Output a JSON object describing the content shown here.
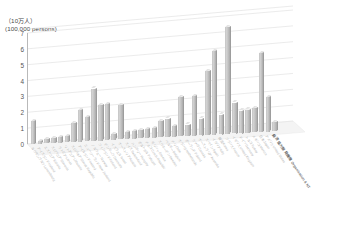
{
  "chart_data": {
    "type": "bar",
    "title": "",
    "ylabel_jp": "（10万人）",
    "ylabel_en": "(100,000 persons)",
    "ylim": [
      0,
      7
    ],
    "yticks": [
      0,
      1,
      2,
      3,
      4,
      5,
      6,
      7
    ],
    "grid": true,
    "legend": "none",
    "projection": "3d-perspective",
    "xlabel": "",
    "categories": [
      "ルクセンブルク Luxembourg",
      "アイスランド Iceland",
      "エストニア Estonia",
      "スロベニア Slovenia",
      "ラトビア Latvia",
      "リトアニア Lithuania",
      "スロバキア Slovak Republic",
      "アイルランド Ireland",
      "ニュージーランド New Zealand",
      "ノルウェー Norway",
      "フィンランド Finland",
      "デンマーク Denmark",
      "イスラエル Israel",
      "オーストリア Austria",
      "スイス Switzerland",
      "ハンガリー Hungary",
      "ポルトガル Portugal",
      "チェコ Czech Republic",
      "ギリシャ Greece",
      "スウェーデン Sweden",
      "ベルギー Belgium",
      "チリ Chile",
      "オランダ Netherlands",
      "ポーランド Poland",
      "カナダ Canada",
      "オーストラリア Australia",
      "スペイン Spain",
      "イタリア Italy",
      "韓国 Korea",
      "フランス France",
      "イギリス United Kingdom",
      "ドイツ Germany",
      "トルコ Turkey",
      "メキシコ Mexico",
      "日本 Japan",
      "アメリカ United States",
      "経済協力開発機構 Organisation & NT"
    ],
    "values": [
      1.45,
      0.15,
      0.25,
      0.3,
      0.35,
      0.4,
      1.2,
      2.0,
      1.55,
      3.35,
      2.25,
      2.3,
      0.35,
      2.2,
      0.45,
      0.5,
      0.55,
      0.6,
      0.65,
      1.05,
      1.2,
      0.7,
      2.55,
      0.75,
      2.6,
      1.1,
      4.2,
      5.5,
      1.3,
      7.05,
      2.05,
      1.5,
      1.55,
      1.6,
      5.3,
      2.3,
      0.6
    ],
    "series": [
      {
        "name": "persons",
        "unit": "100,000 persons",
        "values": [
          1.45,
          0.15,
          0.25,
          0.3,
          0.35,
          0.4,
          1.2,
          2.0,
          1.55,
          3.35,
          2.25,
          2.3,
          0.35,
          2.2,
          0.45,
          0.5,
          0.55,
          0.6,
          0.65,
          1.05,
          1.2,
          0.7,
          2.55,
          0.75,
          2.6,
          1.1,
          4.2,
          5.5,
          1.3,
          7.05,
          2.05,
          1.5,
          1.55,
          1.6,
          5.3,
          2.3,
          0.6
        ]
      }
    ]
  }
}
